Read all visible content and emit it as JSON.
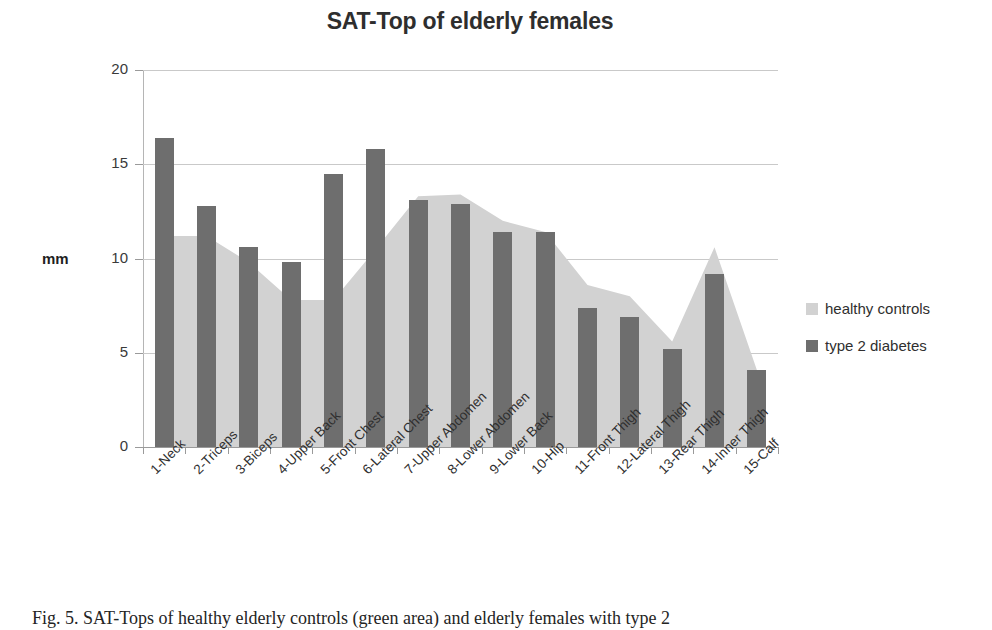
{
  "chart_data": {
    "type": "bar",
    "title": "SAT-Top of elderly females",
    "xlabel": "",
    "ylabel": "mm",
    "ylim": [
      0,
      20
    ],
    "yticks": [
      0,
      5,
      10,
      15,
      20
    ],
    "grid": true,
    "legend_position": "right",
    "categories": [
      "1-Neck",
      "2-Triceps",
      "3-Biceps",
      "4-Upper Back",
      "5-Front Chest",
      "6-Lateral Chest",
      "7-Upper Abdomen",
      "8-Lower Abdomen",
      "9-Lower Back",
      "10-Hip",
      "11-Front Thigh",
      "12-Lateral Thigh",
      "13-Rear Thigh",
      "14-Inner Thigh",
      "15-Calf"
    ],
    "series": [
      {
        "name": "healthy controls",
        "type": "area",
        "color": "#d2d2d2",
        "values": [
          11.2,
          11.2,
          9.8,
          7.8,
          7.8,
          10.5,
          13.3,
          13.4,
          12.0,
          11.4,
          8.6,
          8.0,
          5.6,
          10.6,
          4.1
        ]
      },
      {
        "name": "type 2 diabetes",
        "type": "bar",
        "color": "#6e6e6e",
        "values": [
          16.4,
          12.8,
          10.6,
          9.8,
          14.5,
          15.8,
          13.1,
          12.9,
          11.4,
          11.4,
          7.4,
          6.9,
          5.2,
          9.2,
          4.1
        ]
      }
    ]
  },
  "legend": {
    "items": [
      {
        "label": "healthy controls",
        "color": "#d2d2d2"
      },
      {
        "label": "type 2 diabetes",
        "color": "#6e6e6e"
      }
    ]
  },
  "caption": {
    "text": "Fig. 5. SAT-Tops of healthy elderly controls (green area) and elderly females with type 2"
  }
}
